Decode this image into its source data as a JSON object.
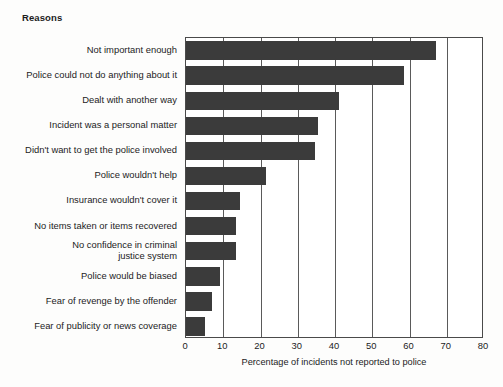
{
  "chart": {
    "title": "Reasons",
    "bar_color": "#3b3b3b",
    "axis_color": "#4a4a4a",
    "grid_color": "#5a5a5a"
  },
  "chart_data": {
    "type": "bar",
    "orientation": "horizontal",
    "title": "Reasons",
    "xlabel": "Percentage of incidents not reported to police",
    "ylabel": "Reasons",
    "xlim": [
      0,
      80
    ],
    "xticks": [
      0,
      10,
      20,
      30,
      40,
      50,
      60,
      70,
      80
    ],
    "xtick_labels": [
      "0",
      "10",
      "20",
      "30",
      "40",
      "50",
      "60",
      "70",
      "80"
    ],
    "grid": true,
    "grid_axis": "x",
    "legend": null,
    "categories": [
      "Not important enough",
      "Police could not do anything about it",
      "Dealt with another way",
      "Incident was a personal matter",
      "Didn't want to get the police involved",
      "Police wouldn't help",
      "Insurance wouldn't cover it",
      "No items taken or items recovered",
      "No confidence in criminal\njustice system",
      "Police would be biased",
      "Fear of revenge by the offender",
      "Fear of publicity or news coverage"
    ],
    "values": [
      67,
      58.5,
      41,
      35.5,
      34.5,
      21.5,
      14.5,
      13.5,
      13.5,
      9,
      7,
      5
    ]
  }
}
